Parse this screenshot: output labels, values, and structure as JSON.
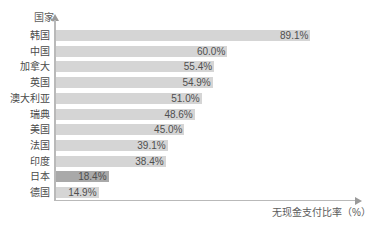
{
  "chart_data": {
    "type": "bar",
    "orientation": "horizontal",
    "title": "",
    "xlabel": "无现金支付比率（%）",
    "ylabel": "国家",
    "xlim": [
      0,
      100
    ],
    "grid": false,
    "legend": null,
    "value_suffix": "%",
    "categories": [
      "韩国",
      "中国",
      "加拿大",
      "英国",
      "澳大利亚",
      "瑞典",
      "美国",
      "法国",
      "印度",
      "日本",
      "德国"
    ],
    "values": [
      89.1,
      60.0,
      55.4,
      54.9,
      51.0,
      48.6,
      45.0,
      39.1,
      38.4,
      18.4,
      14.9
    ],
    "labels": [
      "89.1%",
      "60.0%",
      "55.4%",
      "54.9%",
      "51.0%",
      "48.6%",
      "45.0%",
      "39.1%",
      "38.4%",
      "18.4%",
      "14.9%"
    ],
    "highlight_index": 9,
    "colors": {
      "bar": "#d5d5d5",
      "bar_highlight": "#a9a9a9",
      "axis": "#b9b9b9",
      "text": "#4a4a4a",
      "background": "#ffffff"
    }
  }
}
